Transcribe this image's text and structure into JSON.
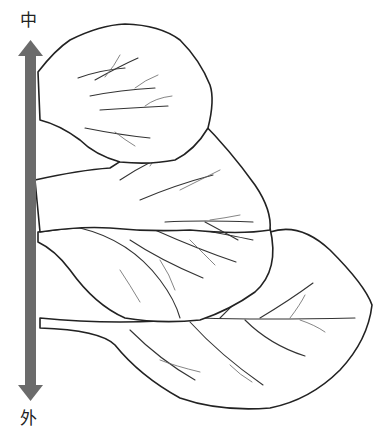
{
  "diagram": {
    "type": "botanical-line-drawing",
    "axis": {
      "top_label": "中",
      "bottom_label": "外",
      "direction": "double-headed vertical arrow",
      "color": "#666666"
    },
    "leaves": [
      {
        "position": "top",
        "description": "innermost leaf, rounded with deeply notched veins"
      },
      {
        "position": "upper-middle",
        "description": "second leaf, overlapping below the first"
      },
      {
        "position": "middle",
        "description": "third leaf, broad with pinnate venation"
      },
      {
        "position": "bottom",
        "description": "outermost and largest leaf, attached by a long petiole"
      }
    ]
  }
}
